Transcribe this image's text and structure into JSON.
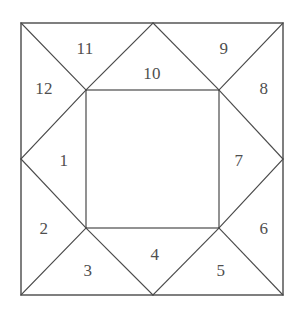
{
  "figure": {
    "canvas": {
      "width": 301,
      "height": 311
    },
    "stroke_color": "#4a4a4a",
    "label_color": "#4f4f4f",
    "background_color": "#ffffff",
    "outer_square": {
      "left": 21,
      "top": 23,
      "right": 283,
      "bottom": 295
    },
    "inner_square": {
      "left": 86,
      "top": 90,
      "right": 219,
      "bottom": 228
    },
    "edge_midpoints": {
      "top": {
        "x": 153,
        "y": 23
      },
      "right": {
        "x": 283,
        "y": 159
      },
      "bottom": {
        "x": 153,
        "y": 295
      },
      "left": {
        "x": 21,
        "y": 159
      }
    },
    "region_count": 12,
    "regions": [
      {
        "label": "1",
        "x": 64,
        "y": 160
      },
      {
        "label": "2",
        "x": 44,
        "y": 228
      },
      {
        "label": "3",
        "x": 88,
        "y": 270
      },
      {
        "label": "4",
        "x": 155,
        "y": 254
      },
      {
        "label": "5",
        "x": 221,
        "y": 270
      },
      {
        "label": "6",
        "x": 264,
        "y": 228
      },
      {
        "label": "7",
        "x": 239,
        "y": 160
      },
      {
        "label": "8",
        "x": 264,
        "y": 88
      },
      {
        "label": "9",
        "x": 224,
        "y": 48
      },
      {
        "label": "10",
        "x": 152,
        "y": 73
      },
      {
        "label": "11",
        "x": 85,
        "y": 48
      },
      {
        "label": "12",
        "x": 44,
        "y": 88
      }
    ]
  }
}
